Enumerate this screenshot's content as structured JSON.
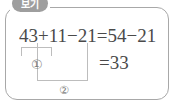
{
  "box": {
    "label": "보기",
    "border_color": "#a8a8a8",
    "label_pill_color": "#9e9e9e"
  },
  "content": {
    "equation_line_1": "43+11−21=54−21",
    "equation_line_2": "=33",
    "text_color": "#4a4a4a"
  },
  "annotations": {
    "bracket_1": {
      "marker": "①",
      "covers": "43+11",
      "orientation": "underbrace-up"
    },
    "bracket_2": {
      "marker": "②",
      "covers": "43+11−21",
      "orientation": "underbrace-down"
    },
    "marker_color": "#7d7d7d",
    "bracket_color": "#bdbdbd"
  }
}
